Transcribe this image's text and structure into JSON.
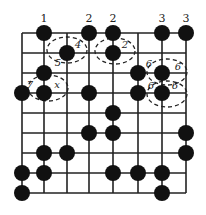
{
  "grid": {
    "xs": [
      22,
      44,
      67,
      89,
      113,
      138,
      162,
      186
    ],
    "ys": [
      33,
      53,
      73,
      93,
      113,
      133,
      153,
      173,
      193
    ],
    "line_color": "#222222",
    "stone_color": "#111111",
    "stone_radius": 8
  },
  "stones": [
    [
      1,
      0
    ],
    [
      3,
      0
    ],
    [
      4,
      0
    ],
    [
      6,
      0
    ],
    [
      7,
      0
    ],
    [
      2,
      1
    ],
    [
      4,
      1
    ],
    [
      1,
      2
    ],
    [
      5,
      2
    ],
    [
      6,
      2
    ],
    [
      0,
      3
    ],
    [
      1,
      3
    ],
    [
      3,
      3
    ],
    [
      5,
      3
    ],
    [
      6,
      3
    ],
    [
      4,
      4
    ],
    [
      3,
      5
    ],
    [
      4,
      5
    ],
    [
      7,
      5
    ],
    [
      1,
      6
    ],
    [
      2,
      6
    ],
    [
      7,
      6
    ],
    [
      0,
      7
    ],
    [
      1,
      7
    ],
    [
      4,
      7
    ],
    [
      5,
      7
    ],
    [
      6,
      7
    ],
    [
      0,
      8
    ],
    [
      6,
      8
    ]
  ],
  "top_labels": [
    {
      "text": "1",
      "x": 44,
      "y": 22
    },
    {
      "text": "2",
      "x": 89,
      "y": 22
    },
    {
      "text": "2",
      "x": 113,
      "y": 22
    },
    {
      "text": "3",
      "x": 162,
      "y": 22
    },
    {
      "text": "3",
      "x": 186,
      "y": 22
    }
  ],
  "ellipses": [
    {
      "cx": 67,
      "cy": 50,
      "rx": 20,
      "ry": 13
    },
    {
      "cx": 115,
      "cy": 51,
      "rx": 20,
      "ry": 13
    },
    {
      "cx": 48,
      "cy": 88,
      "rx": 20,
      "ry": 13
    },
    {
      "cx": 167,
      "cy": 72,
      "rx": 20,
      "ry": 13
    },
    {
      "cx": 167,
      "cy": 94,
      "rx": 20,
      "ry": 13
    }
  ],
  "ellipse_labels": [
    {
      "text": "4",
      "x": 78,
      "y": 48
    },
    {
      "text": "5",
      "x": 58,
      "y": 66
    },
    {
      "text": "2",
      "x": 125,
      "y": 48
    },
    {
      "text": "7",
      "x": 30,
      "y": 88
    },
    {
      "text": "x",
      "x": 57,
      "y": 88
    },
    {
      "text": "6",
      "x": 149,
      "y": 67
    },
    {
      "text": "6",
      "x": 178,
      "y": 70
    },
    {
      "text": "6",
      "x": 151,
      "y": 89
    },
    {
      "text": "6",
      "x": 175,
      "y": 89
    }
  ]
}
